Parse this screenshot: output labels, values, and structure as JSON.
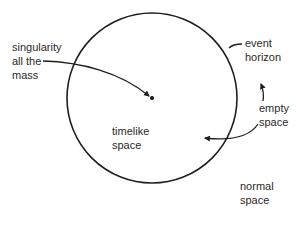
{
  "diagram": {
    "type": "black-hole-schematic",
    "colors": {
      "stroke": "#1f1f1f",
      "text": "#2a2a2a",
      "background": "#ffffff"
    },
    "circle": {
      "cx": 152,
      "cy": 98,
      "r": 85,
      "name": "event horizon"
    },
    "center_point": {
      "x": 152,
      "y": 98
    },
    "labels": {
      "singularity": {
        "lines": [
          "singularity",
          "all the",
          "mass"
        ]
      },
      "event_horizon": {
        "lines": [
          "event",
          "horizon"
        ]
      },
      "empty_space": {
        "lines": [
          "empty",
          "space"
        ]
      },
      "timelike_space": {
        "lines": [
          "timelike",
          "space"
        ]
      },
      "normal_space": {
        "lines": [
          "normal",
          "space"
        ]
      }
    },
    "arrows": [
      {
        "from": "singularity-label",
        "to": "center-point"
      },
      {
        "from": "event-horizon-label",
        "to": "circle-edge"
      },
      {
        "from": "empty-space-label",
        "to": "timelike-region",
        "direction": "inward"
      },
      {
        "from": "empty-space-label",
        "to": "up",
        "direction": "outward"
      }
    ]
  }
}
